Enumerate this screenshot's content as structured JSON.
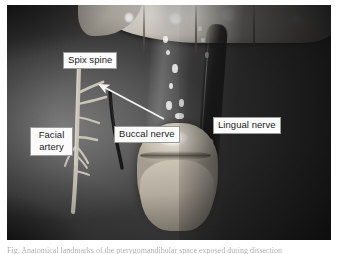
{
  "figure": {
    "photo_style": "grayscale clinical intraoral photograph",
    "caption_sliver_text": "Fig. Anatomical landmarks of the pterygomandibular space exposed during dissection"
  },
  "labels": [
    {
      "id": "spix-spine",
      "text": "Spix spine",
      "lines": [
        "Spix spine"
      ],
      "x": 63,
      "y": 52
    },
    {
      "id": "facial-artery",
      "text": "Facial artery",
      "lines": [
        "Facial",
        "artery"
      ],
      "x": 30,
      "y": 127
    },
    {
      "id": "buccal-nerve",
      "text": "Buccal nerve",
      "lines": [
        "Buccal nerve"
      ],
      "x": 114,
      "y": 126
    },
    {
      "id": "lingual-nerve",
      "text": "Lingual nerve",
      "lines": [
        "Lingual nerve"
      ],
      "x": 213,
      "y": 117
    }
  ],
  "annotations": {
    "arrow": {
      "name": "spix-spine-arrow",
      "from_x": 164,
      "from_y": 119,
      "to_x": 97,
      "to_y": 84,
      "color": "#f2f2f2",
      "description": "white arrow pointing up-left from Buccal nerve label toward the Spix spine"
    }
  },
  "colors": {
    "label_background": "#fbfbfb",
    "label_border": "#9a9a9a",
    "label_text": "#1c1c1c",
    "arrow": "#f2f2f2",
    "page_background": "#ffffff",
    "tooth_enamel": "#e8e5de",
    "mucosa_mid": "#6a6a6a",
    "mucosa_dark": "#303030",
    "artery_highlight": "#cfcabd",
    "nerve_dark": "#181818"
  },
  "geometry": {
    "canvas_width": 338,
    "canvas_height": 254,
    "photo_left": 7,
    "photo_top": 5,
    "photo_width": 324,
    "photo_height": 235
  }
}
